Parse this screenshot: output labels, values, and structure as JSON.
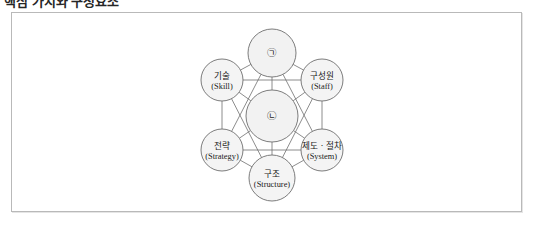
{
  "page": {
    "title_clipped": "핵심 가치와 구성요소"
  },
  "frame": {
    "border_color": "#b9b9b9",
    "background": "#ffffff"
  },
  "diagram": {
    "type": "network",
    "fill_color": "#f4f4f4",
    "stroke_color": "#6e6e6e",
    "hub_nodes": [
      {
        "id": "top-hub",
        "marker": "㉠",
        "cx": 272,
        "cy": 53,
        "r": 24
      },
      {
        "id": "center-hub",
        "marker": "㉡",
        "cx": 272,
        "cy": 116,
        "r": 26
      }
    ],
    "nodes": [
      {
        "id": "skill",
        "ko": "기술",
        "en": "(Skill)",
        "cx": 222,
        "cy": 80,
        "r": 21
      },
      {
        "id": "staff",
        "ko": "구성원",
        "en": "(Staff)",
        "cx": 322,
        "cy": 80,
        "r": 21
      },
      {
        "id": "strategy",
        "ko": "전략",
        "en": "(Strategy)",
        "cx": 222,
        "cy": 150,
        "r": 21
      },
      {
        "id": "system",
        "ko": "제도ㆍ절차",
        "en": "(System)",
        "cx": 322,
        "cy": 150,
        "r": 21
      },
      {
        "id": "structure",
        "ko": "구조",
        "en": "(Structure)",
        "cx": 272,
        "cy": 178,
        "r": 23
      }
    ],
    "edges": [
      [
        "top-hub",
        "skill"
      ],
      [
        "top-hub",
        "staff"
      ],
      [
        "top-hub",
        "center-hub"
      ],
      [
        "top-hub",
        "strategy"
      ],
      [
        "top-hub",
        "system"
      ],
      [
        "skill",
        "staff"
      ],
      [
        "skill",
        "center-hub"
      ],
      [
        "skill",
        "strategy"
      ],
      [
        "skill",
        "structure"
      ],
      [
        "staff",
        "center-hub"
      ],
      [
        "staff",
        "system"
      ],
      [
        "staff",
        "structure"
      ],
      [
        "strategy",
        "center-hub"
      ],
      [
        "strategy",
        "structure"
      ],
      [
        "strategy",
        "system"
      ],
      [
        "system",
        "center-hub"
      ],
      [
        "system",
        "structure"
      ],
      [
        "center-hub",
        "structure"
      ]
    ]
  }
}
